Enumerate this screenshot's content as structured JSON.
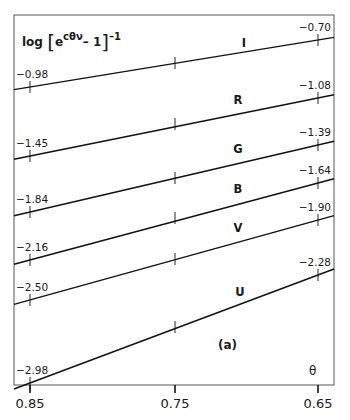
{
  "chart_data": {
    "type": "line",
    "title": "",
    "panel_label": "(a)",
    "ylabel": "log[e^{cθν} - 1]^{-1}",
    "xlabel": "θ",
    "x": [
      0.85,
      0.75,
      0.65
    ],
    "x_tick_labels": [
      "0.85",
      "0.75",
      "0.65"
    ],
    "xlim": [
      0.85,
      0.65
    ],
    "grid": false,
    "legend": "inline labels",
    "series": [
      {
        "name": "I",
        "values": [
          -0.98,
          -0.84,
          -0.7
        ],
        "left_label": "-0.98",
        "right_label": "-0.70"
      },
      {
        "name": "R",
        "values": [
          -1.45,
          -1.265,
          -1.08
        ],
        "left_label": "-1.45",
        "right_label": "-1.08"
      },
      {
        "name": "G",
        "values": [
          -1.84,
          -1.615,
          -1.39
        ],
        "left_label": "-1.84",
        "right_label": "-1.39"
      },
      {
        "name": "B",
        "values": [
          -2.16,
          -1.9,
          -1.64
        ],
        "left_label": "-2.16",
        "right_label": "-1.64"
      },
      {
        "name": "V",
        "values": [
          -2.5,
          -2.2,
          -1.9
        ],
        "left_label": "-2.50",
        "right_label": "-1.90"
      },
      {
        "name": "U",
        "values": [
          -2.98,
          -2.63,
          -2.28
        ],
        "left_label": "-2.98",
        "right_label": "-2.28"
      }
    ]
  },
  "labels": {
    "ylabel_log": "log",
    "ylabel_e": "e",
    "ylabel_exp": "cθν",
    "ylabel_minus1": "– 1",
    "ylabel_power": "–1",
    "panel": "(a)",
    "theta": "θ"
  }
}
